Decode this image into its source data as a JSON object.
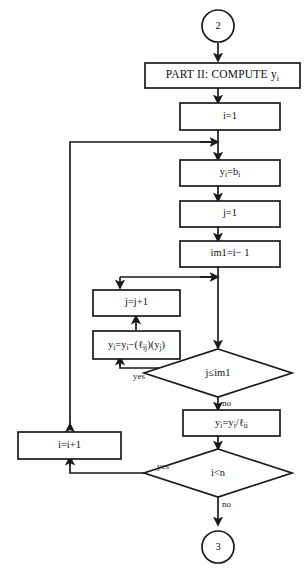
{
  "diagram": {
    "type": "flowchart",
    "stroke_color": "#1a1a1a",
    "fill_color": "#ffffff",
    "background": "#ffffff"
  },
  "connectors": {
    "entry": {
      "label": "2",
      "name": "connector-2"
    },
    "exit": {
      "label": "3",
      "name": "connector-3"
    }
  },
  "nodes": {
    "part_header": {
      "text": "PART II: COMPUTE y",
      "sub": "i"
    },
    "init_i": {
      "text": "i=1"
    },
    "y_eq_b": {
      "lhs": "y",
      "lhs_sub": "i",
      "op": "=",
      "rhs": "b",
      "rhs_sub": "i",
      "plain": "y_i=b_i"
    },
    "init_j": {
      "text": "j=1"
    },
    "im1": {
      "text": "im1=i− 1"
    },
    "j_incr": {
      "text": "j=j+1"
    },
    "y_update": {
      "plain": "y_i=y_i−(ℓ_ij)(y_j)"
    },
    "y_divide": {
      "plain": "y_i=y_i/ℓ_ii"
    },
    "i_incr": {
      "text": "i=i+1"
    }
  },
  "decisions": {
    "inner": {
      "plain": "j≤im1",
      "yes_label": "yes",
      "no_label": "no"
    },
    "outer": {
      "plain": "i<n",
      "yes_label": "yes",
      "no_label": "no"
    }
  },
  "flow": {
    "sequence": [
      "2",
      "PART II: COMPUTE y_i",
      "i=1",
      "y_i=b_i",
      "j=1",
      "im1=i− 1",
      "j≤im1",
      "y_i=y_i−(ℓ_ij)(y_j)",
      "j=j+1",
      "y_i=y_i/ℓ_ii",
      "i<n",
      "i=i+1",
      "3"
    ],
    "loops": [
      {
        "from": "j≤im1",
        "branch": "yes",
        "to": "y_i=y_i−(ℓ_ij)(y_j)"
      },
      {
        "from": "j=j+1",
        "branch": "",
        "to": "j≤im1"
      },
      {
        "from": "i<n",
        "branch": "yes",
        "to": "i=i+1"
      },
      {
        "from": "i=i+1",
        "branch": "",
        "to": "y_i=b_i"
      }
    ]
  }
}
